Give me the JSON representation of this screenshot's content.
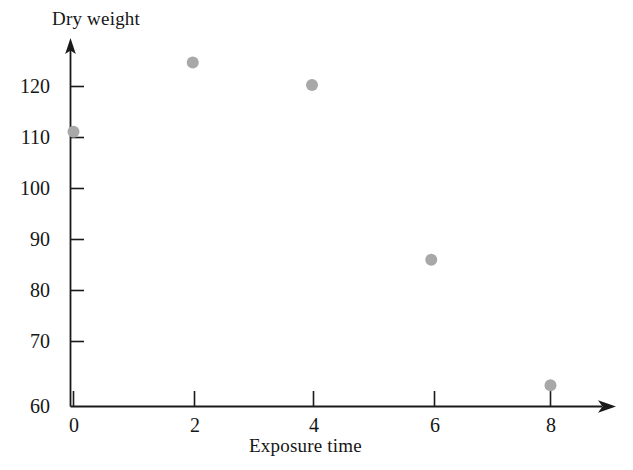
{
  "chart_data": {
    "type": "scatter",
    "title": "",
    "xlabel": "Exposure time",
    "ylabel": "Dry weight",
    "xlim": [
      -0.45,
      9.0
    ],
    "ylim": [
      60,
      128.5
    ],
    "grid": false,
    "legend": false,
    "marker": {
      "shape": "circle",
      "color": "#a8a8a8",
      "radius_px": 6
    },
    "xticks": [
      0,
      2,
      4,
      6,
      8
    ],
    "xtick_labels": [
      "0",
      "2",
      "4",
      "6",
      "8"
    ],
    "yticks": [
      60,
      70,
      80,
      90,
      100,
      110,
      120
    ],
    "ytick_labels": [
      "60",
      "70",
      "80",
      "90",
      "100",
      "110",
      "120"
    ],
    "x": [
      0,
      2,
      4,
      6,
      8
    ],
    "y": [
      111.5,
      124.5,
      120.3,
      87.5,
      64.0
    ],
    "points": [
      {
        "x": 0,
        "y": 111.5
      },
      {
        "x": 2,
        "y": 124.5
      },
      {
        "x": 4,
        "y": 120.3
      },
      {
        "x": 6,
        "y": 87.5
      },
      {
        "x": 8,
        "y": 64.0
      }
    ],
    "axis_style": {
      "arrow_heads": true,
      "axis_color": "#1a1a1a",
      "spine": "left-and-bottom"
    }
  }
}
